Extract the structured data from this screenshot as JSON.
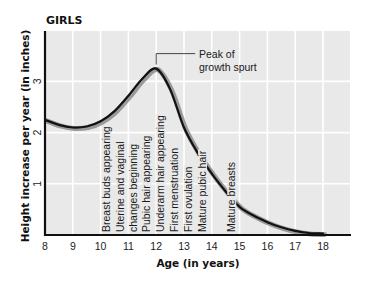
{
  "chart_data": {
    "type": "line",
    "title": "GIRLS",
    "xlabel": "Age (in years)",
    "ylabel": "Height increase per year (in inches)",
    "xlim": [
      8,
      19
    ],
    "ylim": [
      0,
      4
    ],
    "grid": true,
    "x_ticks": [
      "8",
      "9",
      "10",
      "11",
      "12",
      "13",
      "14",
      "15",
      "16",
      "17",
      "18"
    ],
    "y_ticks": [
      "1",
      "2",
      "3"
    ],
    "series": [
      {
        "name": "Girls growth rate",
        "x": [
          8,
          8.5,
          9,
          9.5,
          10,
          10.5,
          11,
          11.5,
          12,
          12.5,
          13,
          13.5,
          14,
          14.5,
          15,
          15.5,
          16,
          16.5,
          17,
          17.5,
          18
        ],
        "y": [
          2.25,
          2.15,
          2.1,
          2.12,
          2.22,
          2.42,
          2.72,
          3.05,
          3.25,
          2.85,
          2.1,
          1.6,
          1.2,
          0.85,
          0.55,
          0.38,
          0.25,
          0.15,
          0.08,
          0.04,
          0.03
        ]
      }
    ],
    "annotations": [
      {
        "text_lines": [
          "Peak of",
          "growth spurt"
        ],
        "x": 12,
        "y": 3.25
      }
    ],
    "events": [
      {
        "label": "Breast buds appearing",
        "x": 10.2
      },
      {
        "label": "Uterine and vaginal",
        "x": 10.7
      },
      {
        "label": "changes beginning",
        "x": 11.15
      },
      {
        "label": "Pubic hair appearing",
        "x": 11.65
      },
      {
        "label": "Underarm hair appearing",
        "x": 12.15
      },
      {
        "label": "First menstruation",
        "x": 12.65
      },
      {
        "label": "First ovulation",
        "x": 13.15
      },
      {
        "label": "Mature pubic hair",
        "x": 13.65
      },
      {
        "label": "Mature breasts",
        "x": 14.7
      }
    ]
  },
  "colors": {
    "plot_background": "#e9e9e9",
    "grid": "#ffffff",
    "curve": "#111111",
    "curve_shadow": "#9a9a9a",
    "axis": "#111111"
  }
}
